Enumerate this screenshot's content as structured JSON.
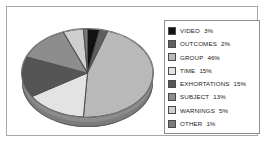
{
  "chart_data": {
    "type": "pie",
    "title": "",
    "subtitle": "",
    "xlabel": "",
    "ylabel": "",
    "grid": false,
    "legend_position": "right",
    "three_d": true,
    "start_angle_deg": 0,
    "direction": "clockwise",
    "categories": [
      "VIDEO",
      "OUTCOMES",
      "GROUP",
      "TIME",
      "EXHORTATIONS",
      "SUBJECT",
      "WARNINGS",
      "OTHER"
    ],
    "values": [
      3,
      2,
      46,
      15,
      15,
      13,
      5,
      1
    ],
    "value_suffix": "%",
    "colors": [
      "#121212",
      "#5f5f5f",
      "#b9b9b9",
      "#e3e3e3",
      "#555555",
      "#8d8d8d",
      "#cfcfcf",
      "#7a7a7a"
    ],
    "slices": [
      {
        "label": "VIDEO",
        "value": 3,
        "display": "3%",
        "color": "#121212"
      },
      {
        "label": "OUTCOMES",
        "value": 2,
        "display": "2%",
        "color": "#5f5f5f"
      },
      {
        "label": "GROUP",
        "value": 46,
        "display": "46%",
        "color": "#b9b9b9"
      },
      {
        "label": "TIME",
        "value": 15,
        "display": "15%",
        "color": "#e3e3e3"
      },
      {
        "label": "EXHORTATIONS",
        "value": 15,
        "display": "15%",
        "color": "#555555"
      },
      {
        "label": "SUBJECT",
        "value": 13,
        "display": "13%",
        "color": "#8d8d8d"
      },
      {
        "label": "WARNINGS",
        "value": 5,
        "display": "5%",
        "color": "#cfcfcf"
      },
      {
        "label": "OTHER",
        "value": 1,
        "display": "1%",
        "color": "#7a7a7a"
      }
    ]
  },
  "legend": {
    "rows": [
      {
        "label": "VIDEO",
        "value": "3%"
      },
      {
        "label": "OUTCOMES",
        "value": "2%"
      },
      {
        "label": "GROUP",
        "value": "46%"
      },
      {
        "label": "TIME",
        "value": "15%"
      },
      {
        "label": "EXHORTATIONS",
        "value": "15%"
      },
      {
        "label": "SUBJECT",
        "value": "13%"
      },
      {
        "label": "WARNINGS",
        "value": "5%"
      },
      {
        "label": "OTHER",
        "value": "1%"
      }
    ]
  },
  "style": {
    "background": "#ffffff",
    "frame_color": "#a8a8a8",
    "legend_border": "#8f8f8f",
    "pie_edge": "#6f6f6f",
    "pie_side": "#7c7c7c"
  }
}
